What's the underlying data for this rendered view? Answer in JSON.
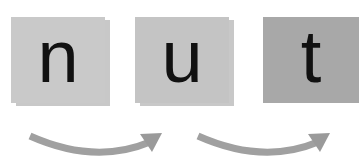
{
  "diagram": {
    "tiles": [
      {
        "letter": "n",
        "color": "#c9c9c9"
      },
      {
        "letter": "u",
        "color": "#c4c4c4"
      },
      {
        "letter": "t",
        "color": "#a8a8a8"
      }
    ],
    "arrows": [
      {
        "from": "n",
        "to": "u",
        "color": "#a0a0a0"
      },
      {
        "from": "u",
        "to": "t",
        "color": "#a0a0a0"
      }
    ]
  }
}
